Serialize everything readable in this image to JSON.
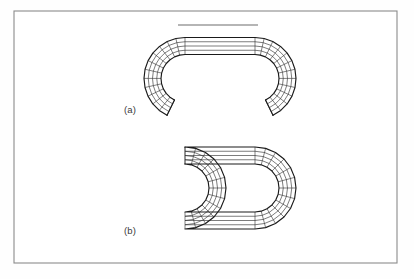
{
  "figure": {
    "background_color": "#fefefe",
    "frame": {
      "name": "figure-border",
      "x": 14,
      "y": 11,
      "width": 383,
      "height": 252,
      "stroke_color": "#8b8b8b"
    },
    "scale_bar": {
      "name": "scale-bar",
      "x1": 178,
      "x2": 258,
      "y": 25,
      "color": "#6c6c6c"
    },
    "panels": [
      {
        "id": "a",
        "label": "(a)",
        "label_x": 124,
        "label_y": 113,
        "caption_note": "open stadium mesh with gap at bottom",
        "geometry": {
          "center_x": 220,
          "center_y": 78.5,
          "straight_half_length": 35,
          "inner_radius": 24,
          "outer_radius": 41,
          "ring_count": 4,
          "radial_divisions_per_arc": 12,
          "straight_divisions": 1,
          "open_bottom": true,
          "gap_half_angle_deg": 26
        }
      },
      {
        "id": "b",
        "label": "(b)",
        "label_x": 124,
        "label_y": 234,
        "caption_note": "closed stadium mesh",
        "geometry": {
          "center_x": 220,
          "center_y": 188,
          "straight_half_length": 35,
          "inner_radius": 24,
          "outer_radius": 41,
          "ring_count": 4,
          "radial_divisions_per_arc": 12,
          "straight_divisions": 1,
          "open_bottom": false,
          "gap_half_angle_deg": 0
        }
      }
    ],
    "colors": {
      "mesh_outline": "#1a1a1a",
      "mesh_interior": "#2b2b2b",
      "label_text": "#3a3a3a",
      "paper": "#ffffff"
    }
  }
}
